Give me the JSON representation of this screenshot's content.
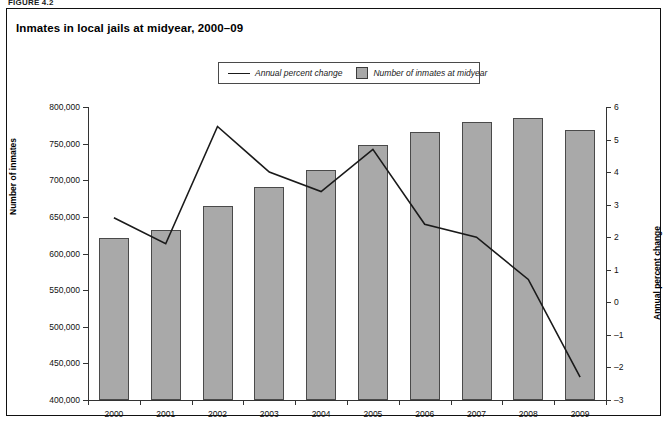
{
  "figure_label": "FIGURE 4.2",
  "title": "Inmates in local jails at midyear, 2000–09",
  "legend": {
    "line_label": "Annual percent change",
    "bar_label": "Number of inmates at midyear"
  },
  "colors": {
    "bar_fill": "#a9a9a9",
    "bar_stroke": "#4a4a4a",
    "line": "#1a1a1a",
    "axis": "#333333",
    "text": "#111111"
  },
  "axes": {
    "left": {
      "label": "Number of inmates",
      "min": 400000,
      "max": 800000,
      "step": 50000,
      "ticks": [
        "400,000",
        "450,000",
        "500,000",
        "550,000",
        "600,000",
        "650,000",
        "700,000",
        "750,000",
        "800,000"
      ]
    },
    "right": {
      "label": "Annual percent change",
      "min": -3,
      "max": 6,
      "step": 1,
      "ticks": [
        "-3",
        "-2",
        "-1",
        "0",
        "1",
        "2",
        "3",
        "4",
        "5",
        "6"
      ]
    },
    "bottom": {
      "label": "",
      "ticks": [
        "2000",
        "2001",
        "2002",
        "2003",
        "2004",
        "2005",
        "2006",
        "2007",
        "2008",
        "2009"
      ]
    }
  },
  "chart_data": {
    "type": "bar",
    "title": "Inmates in local jails at midyear, 2000–09",
    "xlabel": "",
    "ylabel": "Number of inmates",
    "ylabel_secondary": "Annual percent change",
    "categories": [
      "2000",
      "2001",
      "2002",
      "2003",
      "2004",
      "2005",
      "2006",
      "2007",
      "2008",
      "2009"
    ],
    "ylim": [
      400000,
      800000
    ],
    "ylim_secondary": [
      -3,
      6
    ],
    "grid": false,
    "legend_position": "top-center",
    "series": [
      {
        "name": "Number of inmates at midyear",
        "type": "bar",
        "axis": "left",
        "values": [
          621000,
          632000,
          665000,
          691000,
          714000,
          748000,
          766000,
          780000,
          785000,
          768000
        ]
      },
      {
        "name": "Annual percent change",
        "type": "line",
        "axis": "right",
        "values": [
          2.6,
          1.8,
          5.4,
          4.0,
          3.4,
          4.7,
          2.4,
          2.0,
          0.7,
          -2.3
        ]
      }
    ]
  }
}
